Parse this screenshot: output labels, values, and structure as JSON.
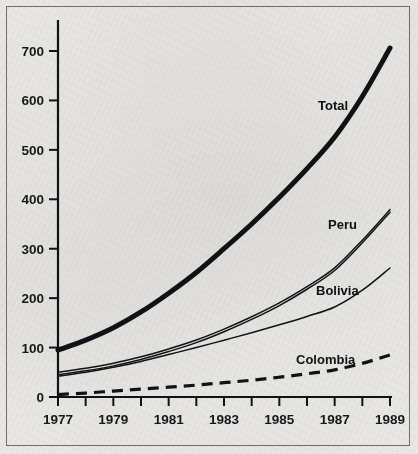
{
  "chart_data": {
    "type": "line",
    "title": "",
    "subtitle": "",
    "xlabel": "",
    "ylabel": "",
    "xlim": [
      1977,
      1989
    ],
    "ylim": [
      0,
      730
    ],
    "yticks": [
      0,
      100,
      200,
      300,
      400,
      500,
      600,
      700
    ],
    "ytick_labels": [
      "0",
      "100",
      "200",
      "300",
      "400",
      "500",
      "600",
      "700"
    ],
    "xticks": [
      1977,
      1978,
      1979,
      1980,
      1981,
      1982,
      1983,
      1984,
      1985,
      1986,
      1987,
      1988,
      1989
    ],
    "xtick_labels": [
      "1977",
      "",
      "1979",
      "",
      "1981",
      "",
      "1983",
      "",
      "1985",
      "",
      "1987",
      "",
      "1989"
    ],
    "x": [
      1977,
      1978,
      1979,
      1980,
      1981,
      1982,
      1983,
      1984,
      1985,
      1986,
      1987,
      1988,
      1989
    ],
    "grid": false,
    "legend_position": "inline-annotations",
    "series": [
      {
        "name": "Total",
        "style": "thick-solid",
        "color": "#121216",
        "width": 5.0,
        "label_x": 1986.0,
        "label_y": 600,
        "values": [
          95,
          115,
          140,
          172,
          210,
          252,
          300,
          350,
          404,
          462,
          526,
          608,
          706
        ]
      },
      {
        "name": "Peru",
        "style": "double-thin-solid",
        "color": "#121216",
        "width": 1.5,
        "label_x": 1986.2,
        "label_y": 352,
        "values": [
          45,
          53,
          63,
          76,
          92,
          110,
          132,
          157,
          185,
          218,
          256,
          312,
          374
        ]
      },
      {
        "name": "Bolivia",
        "style": "thin-solid",
        "color": "#121216",
        "width": 1.5,
        "label_x": 1986.0,
        "label_y": 232,
        "values": [
          42,
          50,
          60,
          72,
          86,
          100,
          115,
          130,
          146,
          163,
          182,
          216,
          261
        ]
      },
      {
        "name": "Colombia",
        "style": "dashed",
        "color": "#121216",
        "width": 3.2,
        "label_x": 1984.7,
        "label_y": 100,
        "values": [
          5,
          8,
          12,
          16,
          20,
          24,
          29,
          34,
          40,
          47,
          55,
          68,
          85
        ]
      }
    ]
  },
  "annotations": {
    "total_label": "Total",
    "peru_label": "Peru",
    "bolivia_label": "Bolivia",
    "colombia_label": "Colombia"
  },
  "axis": {
    "y_700": "700",
    "y_600": "600",
    "y_500": "500",
    "y_400": "400",
    "y_300": "300",
    "y_200": "200",
    "y_100": "100",
    "y_0": "0",
    "x_1977": "1977",
    "x_1979": "1979",
    "x_1981": "1981",
    "x_1983": "1983",
    "x_1985": "1985",
    "x_1987": "1987",
    "x_1989": "1989"
  },
  "colors": {
    "ink": "#121216",
    "paper": "#eceae7",
    "frame": "#6e6d6b"
  }
}
